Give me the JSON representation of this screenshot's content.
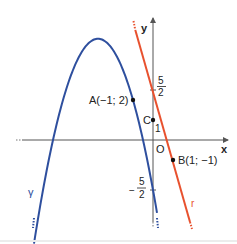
{
  "diagram": {
    "axes": {
      "x_label": "x",
      "y_label": "y",
      "origin_label": "O",
      "color": "#555555"
    },
    "curves": {
      "parabola": {
        "name": "γ",
        "equation": "y = -x^2 - 11/2 x - 5/2",
        "color": "#2e4f9e"
      },
      "line": {
        "name": "r",
        "equation": "y = -7/2 x + 5/2",
        "color": "#e8512e"
      }
    },
    "points": [
      {
        "id": "A",
        "label": "A(−1; 2)",
        "x": -1,
        "y": 2
      },
      {
        "id": "B",
        "label": "B(1; −1)",
        "x": 1,
        "y": -1
      },
      {
        "id": "C",
        "label": "C",
        "x": 0,
        "y": 1
      }
    ],
    "y_ticks": {
      "one": "1",
      "pos_five_halves": {
        "sign": "",
        "num": "5",
        "den": "2"
      },
      "neg_five_halves": {
        "sign": "−",
        "num": "5",
        "den": "2"
      }
    }
  }
}
